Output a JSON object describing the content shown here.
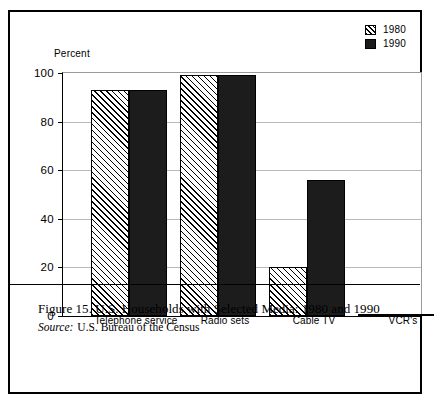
{
  "legend": {
    "entries": [
      {
        "label": "1980",
        "swatch": "hatched-swatch-icon"
      },
      {
        "label": "1990",
        "swatch": "solid-swatch-icon"
      }
    ]
  },
  "caption": {
    "title": "Figure 15. U.S. Households with Selected Media: 1980 and 1990",
    "source_label": "Source:",
    "source_text": "U.S. Bureau of the Census"
  },
  "page_footer": "Figure 15. See Graph 1 of the next page",
  "chart_data": {
    "type": "bar",
    "title": "Figure 15. U.S. Households with Selected Media: 1980 and 1990",
    "xlabel": "",
    "ylabel": "Percent",
    "ylim": [
      0,
      100
    ],
    "yticks": [
      0,
      20,
      40,
      60,
      80,
      100
    ],
    "ytick_labels": [
      "0",
      "20",
      "40",
      "60",
      "80",
      "100"
    ],
    "grid": true,
    "legend_position": "top-right",
    "categories": [
      "Telephone service",
      "Radio sets",
      "Cable TV",
      "VCR's"
    ],
    "series": [
      {
        "name": "1980",
        "fill": "hatched",
        "color": "#ffffff",
        "values": [
          93,
          99,
          20,
          1
        ]
      },
      {
        "name": "1990",
        "fill": "solid",
        "color": "#1c1c1c",
        "values": [
          93,
          99,
          56,
          68.5
        ]
      }
    ]
  }
}
